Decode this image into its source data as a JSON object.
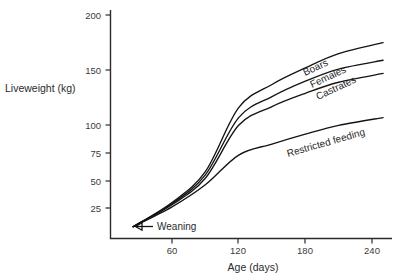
{
  "chart_data": {
    "type": "line",
    "title": "",
    "xlabel": "Age (days)",
    "ylabel": "Liveweight (kg)",
    "xlim": [
      25,
      252
    ],
    "ylim": [
      8,
      205
    ],
    "grid": false,
    "legend": "inline-curve-labels",
    "xticks": [
      60,
      120,
      180,
      240
    ],
    "xticklabels": [
      "60",
      "120",
      "180",
      "240"
    ],
    "yticks": [
      25,
      50,
      75,
      100,
      150,
      200
    ],
    "yticklabels": [
      "25",
      "50",
      "75",
      "100",
      "150",
      "200"
    ],
    "x": [
      25,
      60,
      90,
      120,
      150,
      180,
      210,
      250
    ],
    "series": [
      {
        "name": "Boars",
        "label": "Boars",
        "values": [
          8,
          30,
          58,
          116,
          137,
          152,
          165,
          175
        ]
      },
      {
        "name": "Females",
        "label": "Females",
        "values": [
          8,
          29,
          55,
          107,
          126,
          140,
          151,
          159
        ]
      },
      {
        "name": "Castrates",
        "label": "Castrates",
        "values": [
          8,
          28,
          52,
          100,
          117,
          129,
          139,
          147
        ]
      },
      {
        "name": "Restricted feeding",
        "label": "Restricted feeding",
        "values": [
          8,
          26,
          46,
          73,
          83,
          92,
          100,
          107
        ]
      }
    ],
    "annotations": [
      {
        "name": "weaning",
        "text": "Weaning",
        "arrow": "left-arrow",
        "x": 25,
        "y": 8
      }
    ]
  }
}
